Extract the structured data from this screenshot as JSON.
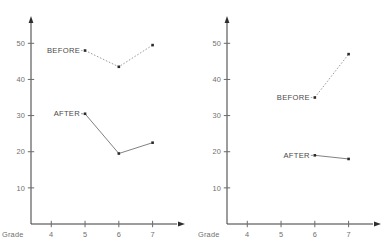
{
  "figure": {
    "background_color": "#ffffff",
    "width": 391,
    "height": 251
  },
  "chart_data": [
    {
      "type": "line",
      "panel": "left",
      "title": "",
      "xlabel": "Grade",
      "ylabel": "",
      "x_tick_labels": [
        "4",
        "5",
        "6",
        "7"
      ],
      "x_tick_values": [
        4,
        5,
        6,
        7
      ],
      "y_tick_labels": [
        "10",
        "20",
        "30",
        "40",
        "50"
      ],
      "y_tick_values": [
        10,
        20,
        30,
        40,
        50
      ],
      "xlim": [
        3.4,
        7.9
      ],
      "ylim": [
        0,
        57
      ],
      "grid": false,
      "legend_position": "inline-labels",
      "series": [
        {
          "name": "BEFORE",
          "style": "dotted",
          "marker": "square",
          "color": "#2b2b2b",
          "x": [
            5,
            6,
            7
          ],
          "values": [
            48,
            43.5,
            49.5
          ]
        },
        {
          "name": "AFTER",
          "style": "solid",
          "marker": "square",
          "color": "#2b2b2b",
          "x": [
            5,
            6,
            7
          ],
          "values": [
            30.5,
            19.5,
            22.5
          ]
        }
      ],
      "annotations": [
        {
          "text": "BEFORE",
          "anchor_x": 5,
          "anchor_y": 48
        },
        {
          "text": "AFTER",
          "anchor_x": 5,
          "anchor_y": 30.5
        }
      ]
    },
    {
      "type": "line",
      "panel": "right",
      "title": "",
      "xlabel": "Grade",
      "ylabel": "",
      "x_tick_labels": [
        "4",
        "5",
        "6",
        "7"
      ],
      "x_tick_values": [
        4,
        5,
        6,
        7
      ],
      "y_tick_labels": [
        "10",
        "20",
        "30",
        "40",
        "50"
      ],
      "y_tick_values": [
        10,
        20,
        30,
        40,
        50
      ],
      "xlim": [
        3.4,
        7.9
      ],
      "ylim": [
        0,
        57
      ],
      "grid": false,
      "legend_position": "inline-labels",
      "series": [
        {
          "name": "BEFORE",
          "style": "dotted",
          "marker": "square",
          "color": "#2b2b2b",
          "x": [
            6,
            7
          ],
          "values": [
            35,
            47
          ]
        },
        {
          "name": "AFTER",
          "style": "solid",
          "marker": "square",
          "color": "#2b2b2b",
          "x": [
            6,
            7
          ],
          "values": [
            19,
            18
          ]
        }
      ],
      "annotations": [
        {
          "text": "BEFORE",
          "anchor_x": 6,
          "anchor_y": 35
        },
        {
          "text": "AFTER",
          "anchor_x": 6,
          "anchor_y": 19
        }
      ]
    }
  ]
}
